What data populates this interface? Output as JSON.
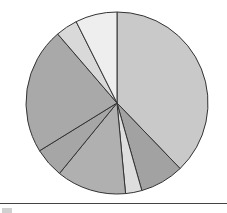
{
  "chart_data": {
    "type": "pie",
    "title": "",
    "center": [
      117,
      103
    ],
    "radius": 91,
    "start_angle_deg": 0,
    "direction": "clockwise",
    "labels": [
      "Slice 1",
      "Slice 2",
      "Slice 3",
      "Slice 4",
      "Slice 5",
      "Slice 6",
      "Slice 7",
      "Slice 8"
    ],
    "values": [
      37.8,
      7.8,
      2.9,
      12.4,
      5.3,
      22.5,
      3.9,
      7.4
    ],
    "colors": [
      "#c9c9c9",
      "#a2a2a2",
      "#dedede",
      "#b0b0b0",
      "#a6a6a6",
      "#a9a9a9",
      "#d9d9d9",
      "#eeeeee"
    ],
    "stroke": "#333333",
    "legend": {
      "position": "bottom",
      "visible_partially": true
    }
  }
}
